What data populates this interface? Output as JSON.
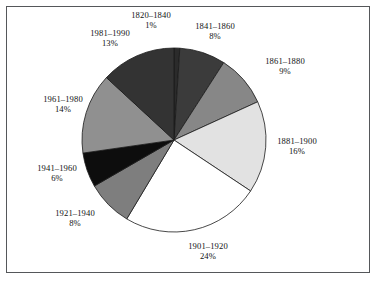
{
  "figure": {
    "frame_color": "#55575a",
    "background": "#ffffff"
  },
  "chart_data": {
    "type": "pie",
    "title": "",
    "subtitle": "",
    "xlabel": "",
    "ylabel": "",
    "legend_position": "none",
    "grid": false,
    "label_format": "category above percent",
    "start_angle_deg": 0,
    "direction": "clockwise",
    "total_percent": 99,
    "categories": [
      "1820–1840",
      "1841–1860",
      "1861–1880",
      "1881–1900",
      "1901–1920",
      "1921–1940",
      "1941–1960",
      "1961–1980",
      "1981–1990"
    ],
    "values": [
      1,
      8,
      9,
      16,
      24,
      8,
      6,
      14,
      13
    ],
    "value_labels": [
      "1%",
      "8%",
      "9%",
      "16%",
      "24%",
      "8%",
      "6%",
      "14%",
      "13%"
    ],
    "colors": [
      "#2b2b2b",
      "#3b3b3b",
      "#878787",
      "#e2e2e2",
      "#ffffff",
      "#7e7e7e",
      "#0d0d0d",
      "#909090",
      "#333333"
    ],
    "slice_edge_color": "#1a1a1a",
    "slices": [
      {
        "category": "1820–1840",
        "value": 1,
        "label": "1%",
        "color": "#2b2b2b",
        "label_x": 151,
        "label_y": 10
      },
      {
        "category": "1841–1860",
        "value": 8,
        "label": "8%",
        "color": "#3b3b3b",
        "label_x": 215,
        "label_y": 21
      },
      {
        "category": "1861–1880",
        "value": 9,
        "label": "9%",
        "color": "#878787",
        "label_x": 285,
        "label_y": 56
      },
      {
        "category": "1881–1900",
        "value": 16,
        "label": "16%",
        "color": "#e2e2e2",
        "label_x": 297,
        "label_y": 136
      },
      {
        "category": "1901–1920",
        "value": 24,
        "label": "24%",
        "color": "#ffffff",
        "label_x": 208,
        "label_y": 241
      },
      {
        "category": "1921–1940",
        "value": 8,
        "label": "8%",
        "color": "#7e7e7e",
        "label_x": 75,
        "label_y": 208
      },
      {
        "category": "1941–1960",
        "value": 6,
        "label": "6%",
        "color": "#0d0d0d",
        "label_x": 57,
        "label_y": 163
      },
      {
        "category": "1961–1980",
        "value": 14,
        "label": "14%",
        "color": "#909090",
        "label_x": 63,
        "label_y": 94
      },
      {
        "category": "1981–1990",
        "value": 13,
        "label": "13%",
        "color": "#333333",
        "label_x": 110,
        "label_y": 28
      }
    ],
    "geometry": {
      "center_x": 174,
      "center_y": 140,
      "radius": 92
    }
  }
}
